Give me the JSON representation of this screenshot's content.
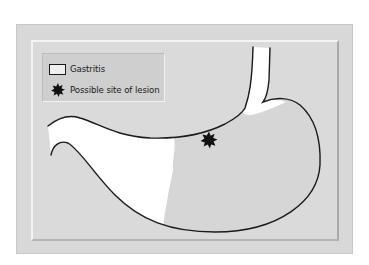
{
  "legend": {
    "items": [
      {
        "label": "Gastritis",
        "icon": "white-square-swatch"
      },
      {
        "label": "Possible site of lesion",
        "icon": "black-starburst-icon"
      }
    ]
  },
  "colors": {
    "outer_panel": "#d8d8d8",
    "inner_panel": "#dadada",
    "gastritis_fill": "#ffffff",
    "stomach_fill": "#d6d6d6",
    "outline": "#1a1a1a",
    "lesion": "#111111"
  }
}
